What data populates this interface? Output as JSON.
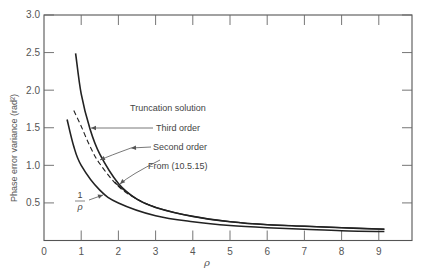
{
  "chart_data": {
    "type": "line",
    "title": "",
    "xlabel": "ρ",
    "ylabel": "Phase error variance  (rad²)",
    "xlim": [
      0,
      10
    ],
    "ylim": [
      0,
      3.0
    ],
    "xticks": [
      0,
      1,
      2,
      3,
      4,
      5,
      6,
      7,
      8,
      9
    ],
    "yticks": [
      0.5,
      1.0,
      1.5,
      2.0,
      2.5,
      3.0
    ],
    "ytick_labels": [
      "0.5",
      "1.0",
      "1.5",
      "2.0",
      "2.5",
      "3.0"
    ],
    "xtick_labels": [
      "0",
      "1",
      "2",
      "3",
      "4",
      "5",
      "6",
      "7",
      "8",
      "9"
    ],
    "grid": false,
    "legend": "none (inline annotations)",
    "series": [
      {
        "name": "Third order (truncation solution)",
        "style": "solid",
        "x": [
          0.85,
          1.0,
          1.24,
          1.5,
          2.0,
          2.5,
          3.0,
          4.0,
          5.0,
          6.0,
          7.0,
          8.0,
          9.15
        ],
        "y": [
          2.49,
          1.95,
          1.48,
          1.15,
          0.76,
          0.55,
          0.44,
          0.32,
          0.25,
          0.21,
          0.19,
          0.17,
          0.15
        ]
      },
      {
        "name": "Second order (truncation solution)",
        "style": "dashed",
        "x": [
          0.8,
          1.0,
          1.24,
          1.5,
          2.0,
          2.5,
          3.0
        ],
        "y": [
          1.73,
          1.52,
          1.25,
          1.02,
          0.72,
          0.55,
          0.44
        ]
      },
      {
        "name": "From (10.5.15)",
        "style": "solid",
        "x": [
          1.9,
          2.0,
          2.5,
          3.0,
          4.0,
          5.0,
          6.0,
          7.0,
          8.0,
          9.15
        ],
        "y": [
          0.78,
          0.73,
          0.55,
          0.44,
          0.32,
          0.25,
          0.21,
          0.19,
          0.17,
          0.15
        ]
      },
      {
        "name": "1/ρ",
        "style": "solid",
        "x": [
          0.62,
          0.8,
          1.0,
          1.5,
          2.0,
          3.0,
          4.0,
          5.0,
          6.0,
          7.0,
          8.0,
          9.15
        ],
        "y": [
          1.61,
          1.25,
          1.0,
          0.67,
          0.5,
          0.33,
          0.25,
          0.2,
          0.17,
          0.15,
          0.13,
          0.12
        ]
      }
    ],
    "annotations": [
      {
        "text": "Truncation solution",
        "x": 2.3,
        "y": 1.78
      },
      {
        "text": "Third order",
        "x": 3.0,
        "y": 1.48,
        "arrow_to": [
          1.24,
          1.48
        ]
      },
      {
        "text": "Second order",
        "x": 2.9,
        "y": 1.25,
        "arrow_to": [
          1.35,
          1.2
        ]
      },
      {
        "text": "From (10.5.15)",
        "x": 2.7,
        "y": 1.02,
        "arrow_to": [
          2.0,
          0.77
        ]
      },
      {
        "text": "1/ρ",
        "x": 1.0,
        "y": 0.6,
        "arrow_to": [
          1.65,
          0.63
        ]
      }
    ]
  },
  "labels": {
    "ylabel": "Phase error variance  (rad²)",
    "xlabel": "ρ",
    "ann_trunc": "Truncation solution",
    "ann_third": "Third order",
    "ann_second": "Second order",
    "ann_from": "From (10.5.15)",
    "ann_inv_num": "1",
    "ann_inv_den": "ρ"
  }
}
